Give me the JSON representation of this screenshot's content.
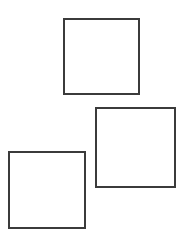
{
  "page": {
    "background_color": "#ffffff",
    "width": 184,
    "height": 244
  },
  "style": {
    "outer_stroke_color": "#3b3b3b",
    "inner_stroke_color": "#4a4a4a",
    "fine_stroke_color": "#585858",
    "fill_color": "#ffffff",
    "outer_stroke_width": 2,
    "inner_stroke_width": 1.4,
    "fine_stroke_width": 1.1
  },
  "chart_data": {
    "type": "diagram",
    "xlabel": "",
    "ylabel": "",
    "figures": [
      {
        "name": "top-square",
        "label": "Top square, 2 by 2 dissection",
        "x": 64,
        "y": 19,
        "size": 75,
        "cell_count": 4,
        "cells": [
          {
            "name": "cell-top-left",
            "x": 0,
            "y": 0,
            "w": 37.5,
            "h": 37.5
          },
          {
            "name": "cell-top-right",
            "x": 37.5,
            "y": 0,
            "w": 37.5,
            "h": 37.5
          },
          {
            "name": "cell-bottom-left",
            "x": 0,
            "y": 37.5,
            "w": 37.5,
            "h": 37.5
          },
          {
            "name": "cell-bottom-right",
            "x": 37.5,
            "y": 37.5,
            "w": 37.5,
            "h": 37.5
          }
        ]
      },
      {
        "name": "bottom-right-square",
        "label": "Bottom right square, L shaped border dissection",
        "x": 96,
        "y": 108,
        "size": 79,
        "cell_count": 8,
        "cells": [
          {
            "name": "cell-top-1",
            "x": 0,
            "y": 0,
            "w": 18,
            "h": 18
          },
          {
            "name": "cell-top-2",
            "x": 18,
            "y": 0,
            "w": 18,
            "h": 18
          },
          {
            "name": "cell-top-3",
            "x": 36,
            "y": 0,
            "w": 18,
            "h": 18
          },
          {
            "name": "cell-right-1",
            "x": 54,
            "y": 0,
            "w": 25,
            "h": 25
          },
          {
            "name": "cell-right-2",
            "x": 54,
            "y": 25,
            "w": 25,
            "h": 18
          },
          {
            "name": "cell-right-3",
            "x": 54,
            "y": 43,
            "w": 25,
            "h": 18
          },
          {
            "name": "cell-right-4",
            "x": 54,
            "y": 61,
            "w": 25,
            "h": 18
          },
          {
            "name": "cell-main-large",
            "x": 0,
            "y": 18,
            "w": 54,
            "h": 61
          }
        ]
      },
      {
        "name": "bottom-left-square",
        "label": "Bottom left square, nested dissection",
        "x": 9,
        "y": 152,
        "size": 76,
        "cell_count": 9,
        "cells": [
          {
            "name": "cell-top-1",
            "x": 0,
            "y": 0,
            "w": 21,
            "h": 21
          },
          {
            "name": "cell-top-2",
            "x": 21,
            "y": 0,
            "w": 28,
            "h": 28
          },
          {
            "name": "cell-top-3",
            "x": 49,
            "y": 0,
            "w": 27,
            "h": 28
          },
          {
            "name": "cell-left-mid",
            "x": 0,
            "y": 21,
            "w": 21,
            "h": 24
          },
          {
            "name": "cell-small-1",
            "x": 0,
            "y": 45,
            "w": 10.5,
            "h": 15.5
          },
          {
            "name": "cell-small-2",
            "x": 10.5,
            "y": 45,
            "w": 10.5,
            "h": 15.5
          },
          {
            "name": "cell-small-3",
            "x": 0,
            "y": 60.5,
            "w": 10.5,
            "h": 15.5
          },
          {
            "name": "cell-small-4",
            "x": 10.5,
            "y": 60.5,
            "w": 10.5,
            "h": 15.5
          },
          {
            "name": "cell-main-large",
            "x": 21,
            "y": 28,
            "w": 55,
            "h": 48
          }
        ]
      }
    ]
  }
}
